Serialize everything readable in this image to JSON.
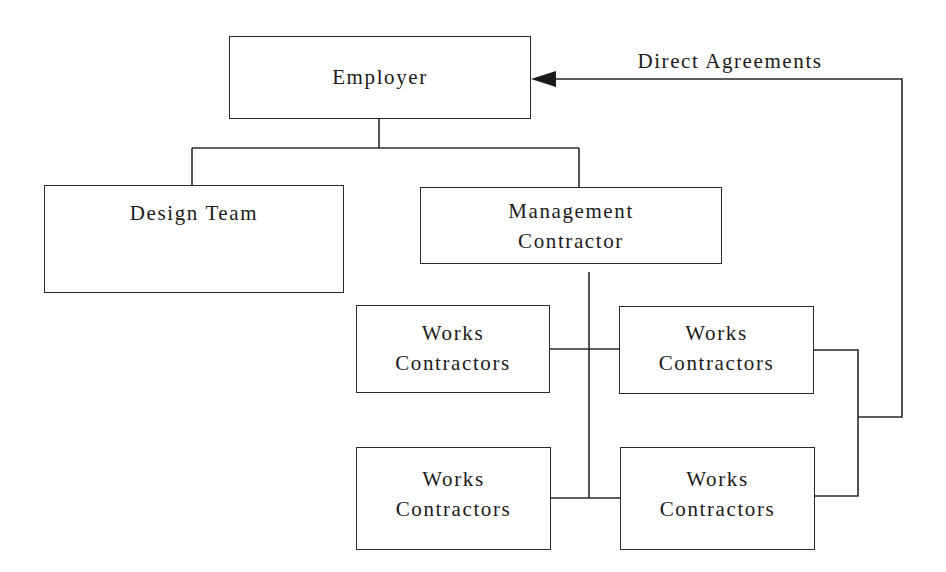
{
  "diagram": {
    "type": "organisation chart",
    "nodes": {
      "employer": {
        "label": "Employer"
      },
      "design_team": {
        "label": "Design Team"
      },
      "management_contractor": {
        "line1": "Management",
        "line2": "Contractor"
      },
      "works_contractors": [
        {
          "line1": "Works",
          "line2": "Contractors"
        },
        {
          "line1": "Works",
          "line2": "Contractors"
        },
        {
          "line1": "Works",
          "line2": "Contractors"
        },
        {
          "line1": "Works",
          "line2": "Contractors"
        }
      ]
    },
    "edges": {
      "direct_agreements": {
        "label": "Direct Agreements"
      }
    },
    "colors": {
      "stroke": "#2a2a2a",
      "background": "#ffffff",
      "text": "#1a1a1a"
    }
  }
}
